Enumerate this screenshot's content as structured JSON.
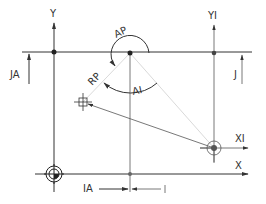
{
  "diagram": {
    "type": "polar-coordinate-programming-diagram",
    "colors": {
      "line": "#333333",
      "light_line": "#c8c8c8",
      "marker": "#222222",
      "background": "#ffffff"
    },
    "labels": {
      "y_axis": "Y",
      "yi_axis": "YI",
      "x_axis": "X",
      "xi_axis": "XI",
      "ja": "JA",
      "j": "J",
      "ia": "IA",
      "i": "I",
      "ap": "AP",
      "rp": "RP",
      "ai": "AI"
    },
    "points": {
      "workpiece_origin": {
        "x": 54,
        "y": 174
      },
      "pole_left": {
        "x": 54,
        "y": 52
      },
      "pole_center": {
        "x": 130,
        "y": 53
      },
      "pole_right": {
        "x": 214,
        "y": 53
      },
      "incremental_origin": {
        "x": 214,
        "y": 148
      },
      "target_point": {
        "x": 83,
        "y": 102
      },
      "bottom_intersection": {
        "x": 130,
        "y": 174
      }
    }
  }
}
